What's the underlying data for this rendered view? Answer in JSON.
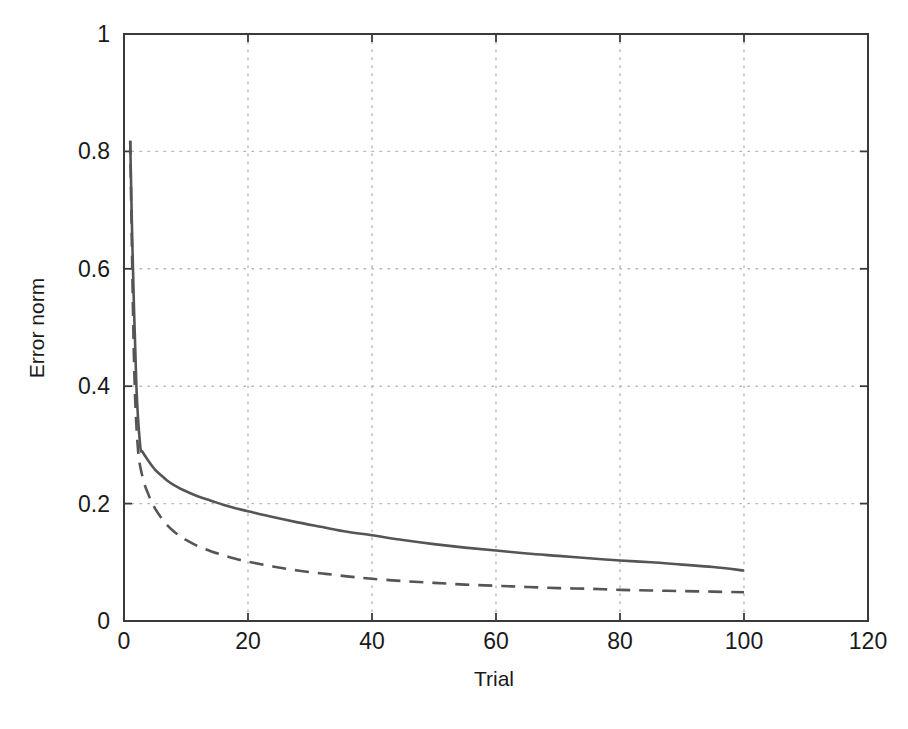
{
  "figure": {
    "name": "error-norm-vs-trial-plot",
    "background_color": "#ffffff",
    "line_color": "#555555",
    "axis_color": "#3a3a3a",
    "grid_color": "#b5b5b5"
  },
  "chart_data": {
    "type": "line",
    "title": "",
    "xlabel": "Trial",
    "ylabel": "Error norm",
    "xlim": [
      0,
      120
    ],
    "ylim": [
      0,
      1
    ],
    "xticks": [
      0,
      20,
      40,
      60,
      80,
      100,
      120
    ],
    "xtick_labels": [
      "0",
      "20",
      "40",
      "60",
      "80",
      "100",
      "120"
    ],
    "yticks": [
      0,
      0.2,
      0.4,
      0.6,
      0.8,
      1
    ],
    "ytick_labels": [
      "0",
      "0.2",
      "0.4",
      "0.6",
      "0.8",
      "1"
    ],
    "grid": true,
    "grid_style": "dotted",
    "legend": null,
    "legend_position": "none",
    "series": [
      {
        "name": "solid-curve",
        "style": "solid",
        "color": "#555555",
        "width": 2.6,
        "x": [
          1,
          1.4,
          2,
          2.6,
          3,
          4,
          5,
          6,
          7,
          8,
          9,
          10,
          12,
          14,
          16,
          18,
          20,
          24,
          28,
          32,
          36,
          40,
          45,
          50,
          55,
          60,
          65,
          70,
          75,
          80,
          85,
          90,
          95,
          100
        ],
        "y": [
          0.818,
          0.62,
          0.4,
          0.3,
          0.288,
          0.272,
          0.258,
          0.248,
          0.239,
          0.232,
          0.226,
          0.221,
          0.212,
          0.205,
          0.198,
          0.192,
          0.187,
          0.177,
          0.168,
          0.16,
          0.152,
          0.146,
          0.138,
          0.131,
          0.125,
          0.12,
          0.115,
          0.111,
          0.107,
          0.103,
          0.1,
          0.096,
          0.092,
          0.086
        ]
      },
      {
        "name": "dashed-curve",
        "style": "dashed",
        "color": "#555555",
        "width": 2.6,
        "dash_pattern": "14 9",
        "x": [
          1,
          1.6,
          2.2,
          3,
          4,
          5,
          6,
          7,
          8,
          9,
          10,
          12,
          14,
          16,
          18,
          20,
          24,
          28,
          32,
          36,
          40,
          45,
          50,
          55,
          60,
          65,
          70,
          75,
          80,
          85,
          90,
          95,
          100
        ],
        "y": [
          0.818,
          0.45,
          0.3,
          0.245,
          0.214,
          0.192,
          0.176,
          0.163,
          0.153,
          0.145,
          0.138,
          0.127,
          0.119,
          0.112,
          0.106,
          0.101,
          0.093,
          0.086,
          0.081,
          0.076,
          0.072,
          0.068,
          0.065,
          0.062,
          0.06,
          0.058,
          0.056,
          0.055,
          0.053,
          0.052,
          0.051,
          0.05,
          0.049
        ]
      }
    ],
    "annotations": []
  },
  "caption": {
    "partial_text": ""
  }
}
